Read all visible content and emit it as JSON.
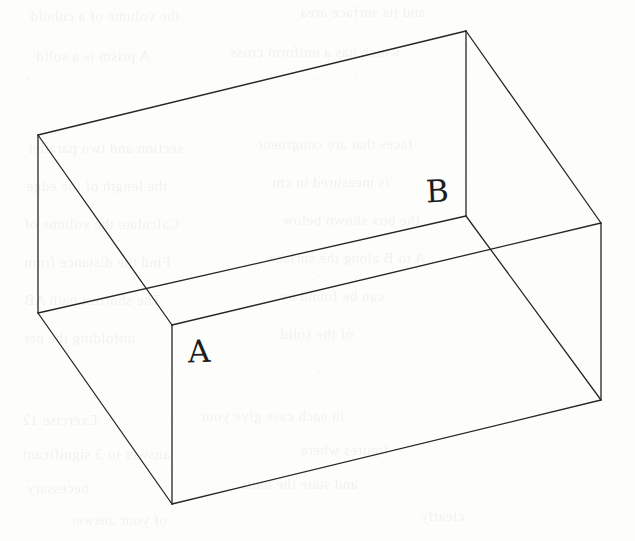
{
  "figure": {
    "kind": "line-drawing",
    "background_color": "#fdfdfc",
    "stroke_color": "#262626",
    "stroke_width": 1.3,
    "canvas": {
      "width": 635,
      "height": 541
    }
  },
  "labels": {
    "point_a": "A",
    "point_b": "B"
  },
  "geometry": {
    "vertices": {
      "top_back_left": {
        "name": "top-back-left",
        "x": 38,
        "y": 135
      },
      "top_back_right": {
        "name": "top-back-right",
        "x": 466,
        "y": 31
      },
      "top_front_right": {
        "name": "top-front-right",
        "x": 601,
        "y": 223
      },
      "top_front_left_A": {
        "name": "top-front-left-A",
        "x": 172,
        "y": 325
      },
      "rim_left": {
        "name": "rim-left",
        "x": 38,
        "y": 313
      },
      "rim_right_B": {
        "name": "rim-right-B",
        "x": 466,
        "y": 216
      },
      "bottom_front": {
        "name": "bottom-front",
        "x": 172,
        "y": 504
      },
      "bottom_right": {
        "name": "bottom-right",
        "x": 601,
        "y": 400
      }
    },
    "edges": [
      {
        "name": "top-back-edge",
        "from": "top_back_left",
        "to": "top_back_right"
      },
      {
        "name": "top-right-edge",
        "from": "top_back_right",
        "to": "top_front_right"
      },
      {
        "name": "top-left-diagonal",
        "from": "top_back_left",
        "to": "top_front_left_A"
      },
      {
        "name": "left-outer-vertical",
        "from": "top_back_left",
        "to": "rim_left"
      },
      {
        "name": "back-vertical",
        "from": "top_back_right",
        "to": "rim_right_B"
      },
      {
        "name": "inner-rim-edge",
        "from": "rim_left",
        "to": "rim_right_B"
      },
      {
        "name": "front-top-edge",
        "from": "top_front_left_A",
        "to": "top_front_right"
      },
      {
        "name": "front-left-vertical",
        "from": "top_front_left_A",
        "to": "bottom_front"
      },
      {
        "name": "bottom-left-diagonal",
        "from": "rim_left",
        "to": "bottom_front"
      },
      {
        "name": "bottom-front-edge",
        "from": "bottom_front",
        "to": "bottom_right"
      },
      {
        "name": "right-vertical",
        "from": "top_front_right",
        "to": "bottom_right"
      },
      {
        "name": "inner-back-diagonal",
        "from": "rim_right_B",
        "to": "bottom_right"
      }
    ]
  },
  "ghost_text": {
    "note": "faint bleed-through of printed text from the reverse of the scanned page",
    "lines": [
      {
        "text": "the volume of a cuboid",
        "x": 30,
        "y": 8,
        "size": 15
      },
      {
        "text": "and its surface area",
        "x": 300,
        "y": 4,
        "size": 15
      },
      {
        "text": "A prism is a solid",
        "x": 36,
        "y": 48,
        "size": 15
      },
      {
        "text": "which has a uniform cross",
        "x": 230,
        "y": 44,
        "size": 15
      },
      {
        "text": "section and two parallel",
        "x": 28,
        "y": 140,
        "size": 15
      },
      {
        "text": "faces that are congruent",
        "x": 258,
        "y": 136,
        "size": 15
      },
      {
        "text": "the length of the edge",
        "x": 26,
        "y": 178,
        "size": 15
      },
      {
        "text": "is measured in cm",
        "x": 272,
        "y": 174,
        "size": 15
      },
      {
        "text": "Calculate the volume of",
        "x": 24,
        "y": 216,
        "size": 15
      },
      {
        "text": "the box shown below",
        "x": 282,
        "y": 212,
        "size": 15
      },
      {
        "text": "Find the distance from",
        "x": 24,
        "y": 254,
        "size": 15
      },
      {
        "text": "A to B along the surface",
        "x": 268,
        "y": 250,
        "size": 15
      },
      {
        "text": "The shortest path AB",
        "x": 24,
        "y": 292,
        "size": 15
      },
      {
        "text": "can be found by",
        "x": 280,
        "y": 288,
        "size": 15
      },
      {
        "text": "unfolding the net",
        "x": 24,
        "y": 330,
        "size": 15
      },
      {
        "text": "of the solid",
        "x": 280,
        "y": 326,
        "size": 15
      },
      {
        "text": "Exercise 12",
        "x": 22,
        "y": 412,
        "size": 15
      },
      {
        "text": "in each case give your",
        "x": 200,
        "y": 408,
        "size": 15
      },
      {
        "text": "answer to 3 significant",
        "x": 22,
        "y": 446,
        "size": 15
      },
      {
        "text": "figures where",
        "x": 300,
        "y": 442,
        "size": 15
      },
      {
        "text": "necessary",
        "x": 26,
        "y": 480,
        "size": 15
      },
      {
        "text": "and state the units",
        "x": 240,
        "y": 476,
        "size": 15
      },
      {
        "text": "of your answer",
        "x": 70,
        "y": 512,
        "size": 15
      },
      {
        "text": "clearly",
        "x": 420,
        "y": 508,
        "size": 15
      }
    ]
  }
}
